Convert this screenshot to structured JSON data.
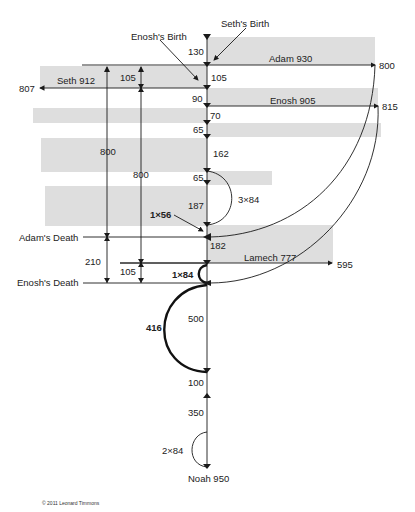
{
  "diagram": {
    "copyright": "© 2011 Leonard Timmons",
    "events": {
      "seths_birth": "Seth's Birth",
      "enoshs_birth": "Enosh's Birth",
      "adams_death": "Adam's Death",
      "enoshs_death": "Enosh's Death"
    },
    "lifelines": [
      {
        "name": "Adam 930",
        "end_value": "800",
        "direction": "right"
      },
      {
        "name": "Seth 912",
        "end_value": "807",
        "direction": "left"
      },
      {
        "name": "Enosh 905",
        "end_value": "815",
        "direction": "right"
      },
      {
        "name": "Lamech 777",
        "end_value": "595",
        "direction": "right"
      },
      {
        "name": "Noah 950",
        "end_value": "",
        "direction": "down"
      }
    ],
    "axis_segments": [
      "130",
      "105",
      "90",
      "70",
      "65",
      "162",
      "65",
      "187",
      "182",
      "500",
      "100",
      "350"
    ],
    "left_spans": {
      "seth_to_adam": "105",
      "adam_long": "800",
      "seth_long": "800",
      "adam_death_to_enosh_death": "210",
      "lamech_to_enosh_death": "105"
    },
    "arcs": {
      "three_84": "3×84",
      "one_56": "1×56",
      "one_84": "1×84",
      "four16": "416",
      "two_84": "2×84"
    },
    "colors": {
      "band": "#dcdcdc",
      "line": "#1a1a1a",
      "background": "#ffffff"
    }
  }
}
